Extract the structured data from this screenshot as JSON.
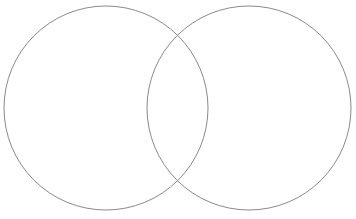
{
  "canvas": {
    "width": 356,
    "height": 219,
    "background_color": "#ffffff",
    "title": "Two-set Venn diagram outline"
  },
  "style": {
    "stroke_color": "#8a8a8a",
    "stroke_width": 1,
    "fill": "none"
  },
  "diagram": {
    "type": "venn-2-set",
    "label_left": "",
    "label_right": "",
    "label_overlap": "",
    "circles": [
      {
        "name": "left-set",
        "cx": 106,
        "cy": 108,
        "r": 102,
        "stroke": "#8a8a8a",
        "stroke_width": 1,
        "fill": "none"
      },
      {
        "name": "right-set",
        "cx": 249,
        "cy": 108,
        "r": 102,
        "stroke": "#8a8a8a",
        "stroke_width": 1,
        "fill": "none"
      }
    ],
    "intersection_points": [
      {
        "x": 177,
        "y": 18
      },
      {
        "x": 177,
        "y": 198
      }
    ]
  }
}
